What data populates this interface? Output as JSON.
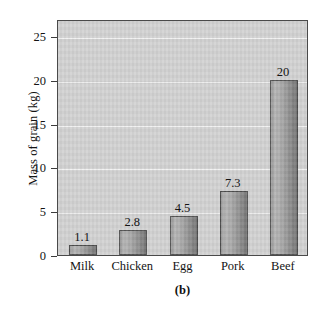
{
  "chart_data": {
    "type": "bar",
    "title": "",
    "caption": "(b)",
    "xlabel": "",
    "ylabel": "Mass of grain (kg)",
    "categories": [
      "Milk",
      "Chicken",
      "Egg",
      "Pork",
      "Beef"
    ],
    "values": [
      1.1,
      2.8,
      4.5,
      7.3,
      20
    ],
    "value_labels": [
      "1.1",
      "2.8",
      "4.5",
      "7.3",
      "20"
    ],
    "ylim": [
      0,
      26.5
    ],
    "yticks": [
      0,
      5,
      10,
      15,
      20,
      25
    ],
    "ytick_labels": [
      "0",
      "5",
      "10",
      "15",
      "20",
      "25"
    ],
    "grid": "horizontal",
    "legend": "none",
    "series": [
      {
        "name": "Mass of grain",
        "values": [
          1.1,
          2.8,
          4.5,
          7.3,
          20
        ]
      }
    ]
  },
  "style": {
    "plot_background": "#d2d2d2",
    "bar_fill_light": "#b4b4b4",
    "bar_fill_dark": "#757575",
    "bar_border": "#4d4d4d",
    "gridline_color": "#f2f2f2",
    "axis_color": "#4a4a4a",
    "text_color": "#141414",
    "page_background": "#ffffff"
  }
}
